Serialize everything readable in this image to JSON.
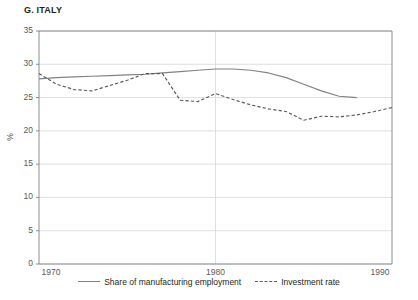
{
  "panel": {
    "label": "G.",
    "title": "G.  ITALY",
    "country": "ITALY"
  },
  "axis": {
    "unit": "%",
    "y_ticks": [
      "0",
      "5",
      "10",
      "15",
      "20",
      "25",
      "30",
      "35"
    ],
    "x_ticks": [
      "1970",
      "1980",
      "1990"
    ]
  },
  "legend": {
    "series1_label": "Share of manufacturing employment",
    "series2_label": "Investment rate"
  },
  "colors": {
    "solid_line": "#808285",
    "dashed_line": "#58595b",
    "grid": "#d6d7d8",
    "axis": "#808285",
    "text": "#231f20",
    "tick_text": "#58595b"
  },
  "chart_data": {
    "type": "line",
    "title": "G.  ITALY",
    "xlabel": "",
    "ylabel": "%",
    "xlim": [
      1970,
      1990
    ],
    "ylim": [
      0,
      35
    ],
    "ytick_interval": 5,
    "grid": "horizontal-and-1980-vertical",
    "legend_position": "bottom-center",
    "series": [
      {
        "name": "Share of manufacturing employment",
        "style": "solid",
        "color": "#808285",
        "x": [
          1970,
          1971,
          1972,
          1973,
          1974,
          1975,
          1976,
          1977,
          1978,
          1979,
          1980,
          1981,
          1982,
          1983,
          1984,
          1985,
          1986,
          1987,
          1988
        ],
        "values": [
          27.8,
          28.0,
          28.1,
          28.2,
          28.3,
          28.4,
          28.5,
          28.7,
          28.9,
          29.1,
          29.3,
          29.3,
          29.1,
          28.7,
          28.0,
          27.0,
          26.0,
          25.2,
          25.0
        ]
      },
      {
        "name": "Investment rate",
        "style": "dashed",
        "color": "#58595b",
        "x": [
          1970,
          1971,
          1972,
          1973,
          1974,
          1975,
          1976,
          1977,
          1978,
          1979,
          1980,
          1981,
          1982,
          1983,
          1984,
          1985,
          1986,
          1987,
          1988,
          1989,
          1990
        ],
        "values": [
          28.6,
          27.0,
          26.2,
          26.0,
          26.8,
          27.6,
          28.6,
          28.6,
          24.6,
          24.4,
          25.6,
          24.7,
          23.9,
          23.3,
          22.9,
          21.6,
          22.2,
          22.1,
          22.4,
          22.9,
          23.5
        ]
      }
    ]
  }
}
